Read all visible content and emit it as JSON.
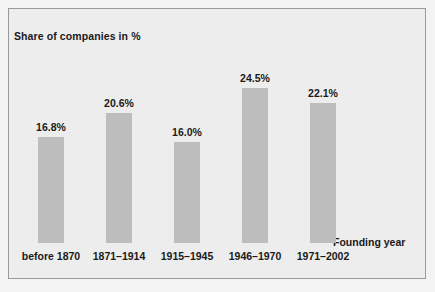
{
  "chart_data": {
    "type": "bar",
    "title": "",
    "subtitle": "",
    "xlabel": "Founding year",
    "ylabel": "Share of companies in %",
    "categories": [
      "before 1870",
      "1871–1914",
      "1915–1945",
      "1946–1970",
      "1971–2002"
    ],
    "values": [
      16.8,
      16.0,
      20.6,
      24.5,
      22.1
    ],
    "series": [
      {
        "name": "Share of companies in %",
        "values": [
          16.8,
          20.6,
          16.0,
          24.5,
          22.1
        ]
      }
    ],
    "data_labels": [
      "16.8%",
      "20.6%",
      "16.0%",
      "24.5%",
      "22.1%"
    ],
    "ylim": [
      0,
      28
    ],
    "grid": false,
    "legend": "none",
    "axis_ticks_visible": false,
    "colors": {
      "bar": "#bdbdbd",
      "panel_background": "#ededed",
      "panel_border": "#9a9a9a",
      "text": "#1a1a1a",
      "figure_background": "#f3f3f3"
    }
  },
  "labels": {
    "ylabel": "Share of companies in %",
    "xlabel": "Founding year"
  },
  "bars": [
    {
      "category": "before 1870",
      "value_label": "16.8%",
      "value": 16.8
    },
    {
      "category": "1871–1914",
      "value_label": "20.6%",
      "value": 20.6
    },
    {
      "category": "1915–1945",
      "value_label": "16.0%",
      "value": 16.0
    },
    {
      "category": "1946–1970",
      "value_label": "24.5%",
      "value": 24.5
    },
    {
      "category": "1971–2002",
      "value_label": "22.1%",
      "value": 22.1
    }
  ]
}
